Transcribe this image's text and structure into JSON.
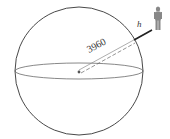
{
  "diagram": {
    "radius_label": "3960",
    "height_label": "h",
    "colors": {
      "stroke": "#333333",
      "dashed": "#555555",
      "person": "#777777"
    }
  }
}
